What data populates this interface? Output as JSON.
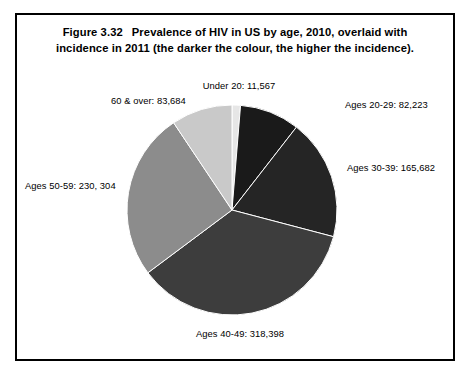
{
  "figure": {
    "number": "Figure 3.32",
    "caption_line_1": "Prevalence of HIV in US by age, 2010, overlaid with",
    "caption_line_2": "incidence in 2011 (the darker the colour, the higher the incidence)."
  },
  "labels": {
    "under_20": "Under 20: 11,567",
    "ages_20_29": "Ages 20-29: 82,223",
    "ages_30_39": "Ages 30-39: 165,682",
    "ages_40_49": "Ages 40-49: 318,398",
    "ages_50_59": "Ages 50-59: 230, 304",
    "age_60_over": "60 & over: 83,684"
  },
  "chart_data": {
    "type": "pie",
    "xlabel": "",
    "ylabel": "",
    "legend_position": "none",
    "grid": false,
    "start_angle_deg": 0,
    "direction": "clockwise",
    "total": 891858,
    "categories": [
      "Under 20",
      "Ages 20-29",
      "Ages 30-39",
      "Ages 40-49",
      "Ages 50-59",
      "60 & over"
    ],
    "values": [
      11567,
      82223,
      165682,
      318398,
      230304,
      83684
    ],
    "data_labels": [
      "Under 20: 11,567",
      "Ages 20-29: 82,223",
      "Ages 30-39: 165,682",
      "Ages 40-49: 318,398",
      "Ages 50-59: 230, 304",
      "60 & over: 83,684"
    ],
    "colors": [
      "#e6e6e6",
      "#1a1a1a",
      "#252525",
      "#3d3d3d",
      "#8c8c8c",
      "#c9c9c9"
    ],
    "annotations": [
      "the darker the colour, the higher the incidence"
    ]
  },
  "style": {
    "frame_color": "#000000",
    "background": "#ffffff",
    "text_color": "#000000"
  }
}
